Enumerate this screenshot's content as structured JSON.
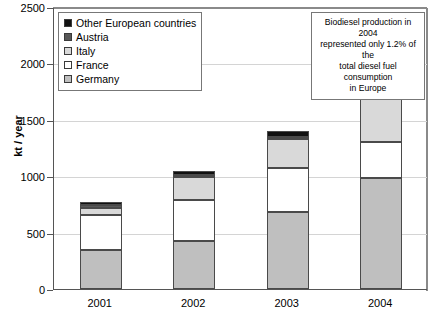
{
  "chart_data": {
    "type": "bar",
    "subtype": "stacked-bar",
    "title": "",
    "xlabel": "",
    "ylabel": "kt / year",
    "ylim": [
      0,
      2500
    ],
    "ytick_values": [
      0,
      500,
      1000,
      1500,
      2000,
      2500
    ],
    "ytick_labels": [
      "0",
      "500",
      "1000",
      "1500",
      "2000",
      "2500"
    ],
    "categories": [
      "2001",
      "2002",
      "2003",
      "2004"
    ],
    "grid": true,
    "grid_axis": "y",
    "legend_position": "top-left inside plot",
    "stack_order_bottom_to_top": [
      "Germany",
      "France",
      "Italy",
      "Austria",
      "Other European countries"
    ],
    "series": [
      {
        "name": "Germany",
        "values": [
          350,
          430,
          680,
          980
        ],
        "color": "#bfbfbf"
      },
      {
        "name": "France",
        "values": [
          310,
          360,
          390,
          320
        ],
        "color": "#ffffff"
      },
      {
        "name": "Italy",
        "values": [
          60,
          200,
          260,
          400
        ],
        "color": "#d9d9d9"
      },
      {
        "name": "Austria",
        "values": [
          25,
          25,
          20,
          120
        ],
        "color": "#585858"
      },
      {
        "name": "Other European countries",
        "values": [
          25,
          30,
          50,
          70
        ],
        "color": "#111111"
      }
    ],
    "totals": [
      770,
      1045,
      1400,
      1890
    ],
    "annotations": [
      {
        "name": "biodiesel-share-note",
        "lines": [
          "Biodiesel production in 2004",
          "represented only 1.2% of the",
          "total diesel fuel consumption",
          "in Europe"
        ]
      }
    ]
  },
  "axes": {
    "y_title": "kt / year",
    "y_ticks": [
      {
        "label": "2500",
        "value": 2500
      },
      {
        "label": "2000",
        "value": 2000
      },
      {
        "label": "1500",
        "value": 1500
      },
      {
        "label": "1000",
        "value": 1000
      },
      {
        "label": "500",
        "value": 500
      },
      {
        "label": "0",
        "value": 0
      }
    ],
    "x_ticks": [
      "2001",
      "2002",
      "2003",
      "2004"
    ]
  },
  "legend": {
    "items": [
      {
        "label": "Other European countries",
        "color": "#111111"
      },
      {
        "label": "Austria",
        "color": "#585858"
      },
      {
        "label": "Italy",
        "color": "#d9d9d9"
      },
      {
        "label": "France",
        "color": "#ffffff"
      },
      {
        "label": "Germany",
        "color": "#bfbfbf"
      }
    ]
  },
  "annotation": {
    "line1": "Biodiesel production in 2004",
    "line2": "represented only 1.2% of the",
    "line3": "total diesel fuel consumption",
    "line4": "in Europe"
  },
  "caption": {
    "text": ""
  },
  "colors": {
    "other": "#111111",
    "austria": "#585858",
    "italy": "#d9d9d9",
    "france": "#ffffff",
    "germany": "#bfbfbf",
    "axis": "#555555",
    "grid": "#d4d4d4",
    "bar_outline": "#4a4a4a"
  }
}
